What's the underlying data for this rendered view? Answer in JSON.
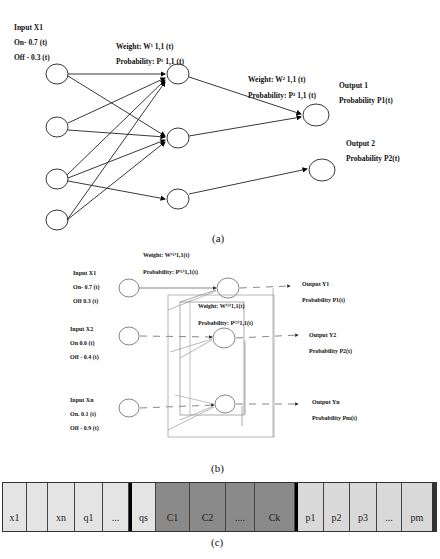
{
  "panel_a": {
    "caption": "(a)",
    "input_label": "Input    X1",
    "on_label": "On-   0.7 (t)",
    "off_label": "Off  - 0.3 (t)",
    "weight1": "Weight: W¹ 1,1 (t)",
    "prob1": "Probability: P¹ 1,1 (t)",
    "weight2": "Weight: W² 1,1 (t)",
    "prob2": "Probability: P² 1,1 (t)",
    "output1": "Output  1",
    "output1_prob": "Probability P1(t)",
    "output2": "Output  2",
    "output2_prob": "Probability P2(t)"
  },
  "panel_b": {
    "caption": "(b)",
    "weight_top": "Weight: W⁽¹⁾1,1(t)",
    "prob_top": "Probability: P⁽¹⁾1,1(t)",
    "weight_mid": "Weight: W⁽²⁾1,1(t)",
    "prob_mid": "Probability: P⁽²⁾1,1(t)",
    "inputs": [
      {
        "name": "Input    X1",
        "on": "On-   0.7 (t)",
        "off": "Off   0.3 (t)"
      },
      {
        "name": "Input    X2",
        "on": "On    0.6 (t)",
        "off": "Off - 0.4 (t)"
      },
      {
        "name": "Input    Xn",
        "on": "On.   0.1 (t)",
        "off": "Off - 0.9 (t)"
      }
    ],
    "outputs": [
      {
        "name": "Output  Y1",
        "prob": "Probability P1(t)"
      },
      {
        "name": "Output  Y2",
        "prob": "Probability P2(t)"
      },
      {
        "name": "Output  Yn",
        "prob": "Probability Pm(t)"
      }
    ]
  },
  "panel_c": {
    "caption": "(c)",
    "cells": [
      {
        "label": "x1",
        "tone": "light"
      },
      {
        "label": "",
        "tone": "light"
      },
      {
        "label": "xn",
        "tone": "light"
      },
      {
        "label": "q1",
        "tone": "light"
      },
      {
        "label": "...",
        "tone": "light"
      },
      {
        "label": "qs",
        "tone": "light"
      },
      {
        "label": "C1",
        "tone": "dark"
      },
      {
        "label": "C2",
        "tone": "dark"
      },
      {
        "label": "....",
        "tone": "dark"
      },
      {
        "label": "Ck",
        "tone": "dark"
      },
      {
        "label": "p1",
        "tone": "pl"
      },
      {
        "label": "p2",
        "tone": "pl"
      },
      {
        "label": "p3",
        "tone": "pl"
      },
      {
        "label": "...",
        "tone": "pl"
      },
      {
        "label": "pm",
        "tone": "pl"
      }
    ]
  }
}
